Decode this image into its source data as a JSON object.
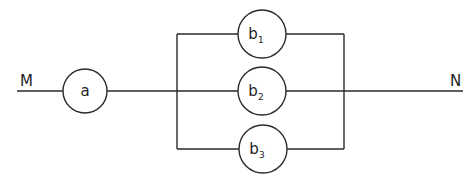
{
  "diagram": {
    "type": "reliability-block-diagram",
    "terminals": {
      "start": "M",
      "end": "N"
    },
    "series_element": {
      "id": "a",
      "label": "a"
    },
    "parallel_elements": [
      {
        "id": "b1",
        "base": "b",
        "subscript": "1"
      },
      {
        "id": "b2",
        "base": "b",
        "subscript": "2"
      },
      {
        "id": "b3",
        "base": "b",
        "subscript": "3"
      }
    ],
    "connections": [
      [
        "M",
        "a"
      ],
      [
        "a",
        "b1"
      ],
      [
        "a",
        "b2"
      ],
      [
        "a",
        "b3"
      ],
      [
        "b1",
        "N"
      ],
      [
        "b2",
        "N"
      ],
      [
        "b3",
        "N"
      ]
    ],
    "colors": {
      "line": "#2a2a2a",
      "background": "#ffffff"
    }
  }
}
